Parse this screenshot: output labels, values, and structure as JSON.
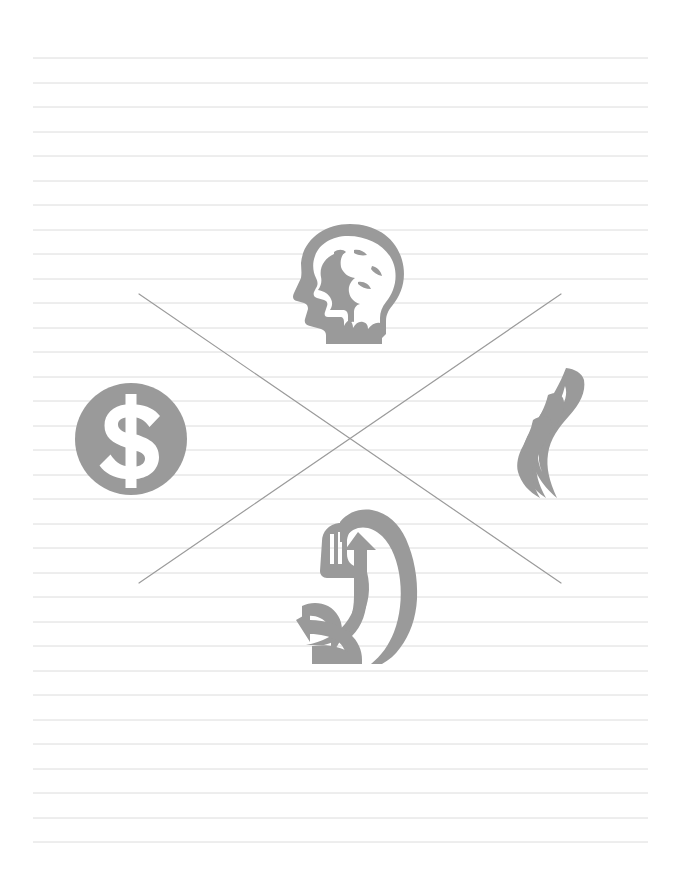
{
  "page": {
    "title": "Lined notebook page with crossed-out concept icons",
    "width": 676,
    "height": 878,
    "background_color": "#ffffff"
  },
  "ruled_paper": {
    "name": "ruled-lines",
    "line_color": "#dcdcdc",
    "line_thickness": 1,
    "line_left_x": 33,
    "line_right_x": 648,
    "first_line_y": 58,
    "line_spacing": 24.6,
    "line_count": 33,
    "line_y_positions": [
      58,
      83,
      107,
      132,
      156,
      181,
      205,
      230,
      254,
      279,
      303,
      328,
      352,
      377,
      401,
      426,
      450,
      475,
      499,
      524,
      548,
      573,
      597,
      622,
      646,
      671,
      695,
      720,
      744,
      769,
      793,
      818,
      842
    ]
  },
  "cross_mark": {
    "name": "cross-out-mark",
    "label": "X",
    "stroke_color": "#9b9b9b",
    "stroke_width": 1.2,
    "stroke_1": {
      "x1": 139,
      "y1": 294,
      "x2": 561,
      "y2": 583
    },
    "stroke_2": {
      "x1": 561,
      "y1": 294,
      "x2": 139,
      "y2": 583
    }
  },
  "icons": {
    "fill_color": "#9a9a9a",
    "items": [
      {
        "id": "brain-head-icon",
        "label": "Mind",
        "semantic": "brain-head-icon",
        "position": "top-center",
        "x": 288,
        "y": 222,
        "width": 122,
        "height": 122
      },
      {
        "id": "dollar-coin-icon",
        "label": "Money",
        "semantic": "dollar-coin-icon",
        "symbol": "$",
        "position": "left",
        "x": 70,
        "y": 378,
        "width": 122,
        "height": 122
      },
      {
        "id": "flame-icon",
        "label": "Passion",
        "semantic": "flame-icon",
        "position": "right",
        "x": 516,
        "y": 368,
        "width": 82,
        "height": 132
      },
      {
        "id": "flexed-bicep-icon",
        "label": "Strength",
        "semantic": "flexed-bicep-icon",
        "position": "bottom-center",
        "x": 296,
        "y": 508,
        "width": 126,
        "height": 156
      }
    ]
  }
}
